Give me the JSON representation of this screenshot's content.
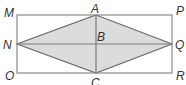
{
  "diagram": {
    "type": "geometry",
    "colors": {
      "stroke": "#7a7a7a",
      "fill": "#d9d9d9",
      "label": "#333333"
    },
    "rectangle": [
      "M",
      "P",
      "R",
      "O"
    ],
    "rhombus": [
      "A",
      "Q",
      "C",
      "N"
    ],
    "labels": {
      "M": "M",
      "P": "P",
      "O": "O",
      "R": "R",
      "A": "A",
      "B": "B",
      "C": "C",
      "N": "N",
      "Q": "Q"
    }
  }
}
